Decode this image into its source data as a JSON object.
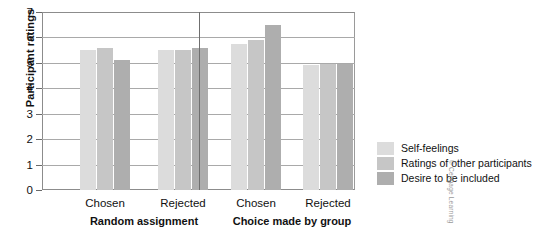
{
  "chart_data": {
    "type": "bar",
    "title": "",
    "xlabel": "",
    "ylabel": "Participant ratings",
    "ylim": [
      0,
      7
    ],
    "yticks": [
      0,
      1,
      2,
      3,
      4,
      5,
      6,
      7
    ],
    "grid": true,
    "legend_position": "right",
    "categories": [
      "Chosen",
      "Rejected",
      "Chosen",
      "Rejected"
    ],
    "panels": [
      {
        "label": "Random assignment",
        "categories": [
          "Chosen",
          "Rejected"
        ]
      },
      {
        "label": "Choice made by group",
        "categories": [
          "Chosen",
          "Rejected"
        ]
      }
    ],
    "series": [
      {
        "name": "Self-feelings",
        "color": "#dcdcdc",
        "values": [
          5.5,
          5.5,
          5.75,
          4.9
        ]
      },
      {
        "name": "Ratings of other participants",
        "color": "#c6c6c6",
        "values": [
          5.6,
          5.5,
          5.9,
          4.95
        ]
      },
      {
        "name": "Desire to be included",
        "color": "#aeaeae",
        "values": [
          5.1,
          5.6,
          6.5,
          4.95
        ]
      }
    ]
  },
  "legend": {
    "items": [
      {
        "label": "Self-feelings",
        "color": "#dcdcdc"
      },
      {
        "label": "Ratings of other participants",
        "color": "#c6c6c6"
      },
      {
        "label": "Desire to be included",
        "color": "#aeaeae"
      }
    ]
  },
  "credit": "© Cengage Learning"
}
